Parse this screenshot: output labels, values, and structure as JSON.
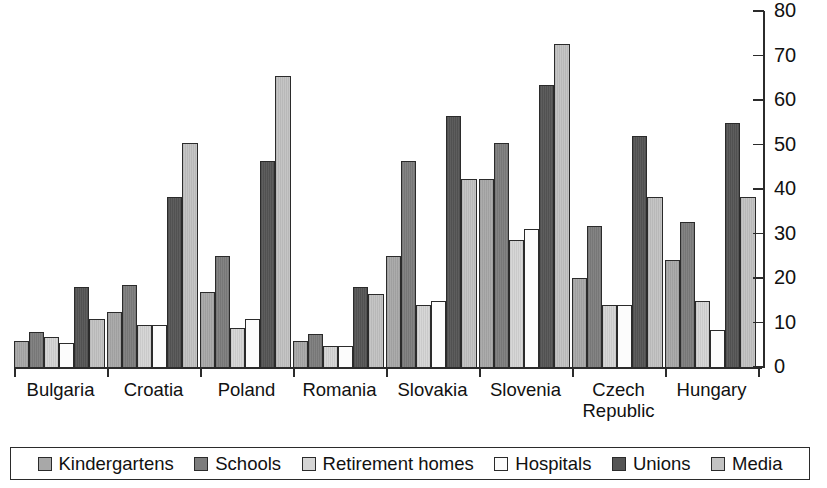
{
  "chart_data": {
    "type": "bar",
    "title": "",
    "subtitle": "",
    "xlabel": "",
    "ylabel": "",
    "ylim": [
      0,
      80
    ],
    "yticks": [
      0,
      10,
      20,
      30,
      40,
      50,
      60,
      70,
      80
    ],
    "grid": false,
    "legend_position": "bottom",
    "axis_side": "right",
    "categories": [
      "Bulgaria",
      "Croatia",
      "Poland",
      "Romania",
      "Slovakia",
      "Slovenia",
      "Czech Republic",
      "Hungary"
    ],
    "category_label_lines": [
      [
        "Bulgaria"
      ],
      [
        "Croatia"
      ],
      [
        "Poland"
      ],
      [
        "Romania"
      ],
      [
        "Slovakia"
      ],
      [
        "Slovenia"
      ],
      [
        "Czech",
        "Republic"
      ],
      [
        "Hungary"
      ]
    ],
    "series": [
      {
        "name": "Kindergartens",
        "color": "#a8a8a8",
        "values": [
          6,
          12.5,
          17,
          6,
          25,
          42,
          20,
          24
        ]
      },
      {
        "name": "Schools",
        "color": "#7d7d7d",
        "values": [
          8,
          18.5,
          25,
          7.5,
          46,
          50,
          31.5,
          32.5
        ]
      },
      {
        "name": "Retirement homes",
        "color": "#d5d5d5",
        "values": [
          7,
          9.5,
          9,
          5,
          14,
          28.5,
          14,
          15
        ]
      },
      {
        "name": "Hospitals",
        "color": "#fcfcfc",
        "values": [
          5.5,
          9.5,
          11,
          5,
          15,
          31,
          14,
          8.5
        ]
      },
      {
        "name": "Unions",
        "color": "#555555",
        "values": [
          18,
          38,
          46,
          18,
          56,
          63,
          51.5,
          54.5
        ]
      },
      {
        "name": "Media",
        "color": "#c2c2c2",
        "values": [
          11,
          50,
          65,
          16.5,
          42,
          72,
          38,
          38
        ]
      }
    ]
  }
}
